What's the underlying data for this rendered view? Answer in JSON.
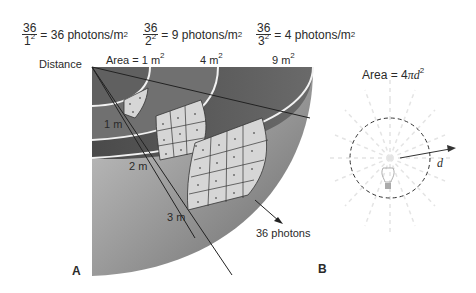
{
  "equations": [
    {
      "numerator": "36",
      "denominator": "1",
      "exponent": "2",
      "result": "= 36 photons/m",
      "result_exp": "2"
    },
    {
      "numerator": "36",
      "denominator": "2",
      "exponent": "2",
      "result": "= 9 photons/m",
      "result_exp": "2"
    },
    {
      "numerator": "36",
      "denominator": "3",
      "exponent": "2",
      "result": "= 4 photons/m",
      "result_exp": "2"
    }
  ],
  "panel_a": {
    "label": "A",
    "distance_label": "Distance",
    "area_labels": [
      {
        "text": "Area = 1 m",
        "exp": "2"
      },
      {
        "text": "4 m",
        "exp": "2"
      },
      {
        "text": "9 m",
        "exp": "2"
      }
    ],
    "distance_markers": [
      "1 m",
      "2 m",
      "3 m"
    ],
    "photons_label": "36 photons"
  },
  "panel_b": {
    "label": "B",
    "formula": "Area = 4",
    "formula_italic": "πd",
    "formula_exp": "2",
    "radius_label": "d"
  },
  "colors": {
    "shell_dark": "#5a5a5a",
    "shell_mid": "#8a8a8a",
    "shell_light": "#c8c8c8",
    "patch_fill": "#d9d9d9",
    "ring_white": "#f5f5f5"
  }
}
